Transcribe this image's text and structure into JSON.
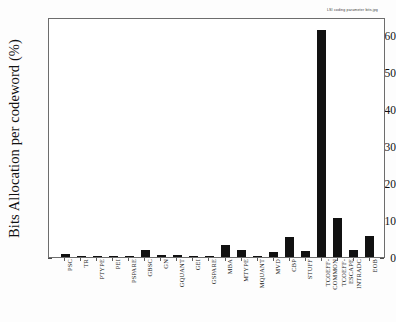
{
  "header_note": "LSI coding parameter bits.jpg",
  "chart_data": {
    "type": "bar",
    "title": "",
    "subtitle": "",
    "xlabel": "",
    "ylabel": "Bits Allocation per codeword (%)",
    "ylim": [
      0,
      65
    ],
    "yticks": [
      0,
      10,
      20,
      30,
      40,
      50,
      60
    ],
    "ytick_labels": [
      "0",
      "10",
      "20",
      "30",
      "40",
      "50",
      "60"
    ],
    "grid": false,
    "legend": null,
    "bar_color": "#111111",
    "categories": [
      "PSC",
      "TR",
      "PTYPE",
      "PEI",
      "PSPARE",
      "GBSC",
      "GN",
      "GQUANT",
      "GEI",
      "GSPARE",
      "MBA",
      "MTYPE",
      "MQUANT",
      "MVD",
      "CBP",
      "STUFF",
      "TCOEFF-COMMON",
      "TCOEFF-ESCAPE",
      "INTRADC",
      "EOB"
    ],
    "category_lines": [
      [
        "PSC"
      ],
      [
        "TR"
      ],
      [
        "PTYPE"
      ],
      [
        "PEI"
      ],
      [
        "PSPARE"
      ],
      [
        "GBSC"
      ],
      [
        "GN"
      ],
      [
        "GQUANT"
      ],
      [
        "GEI"
      ],
      [
        "GSPARE"
      ],
      [
        "MBA"
      ],
      [
        "MTYPE"
      ],
      [
        "MQUANT"
      ],
      [
        "MVD"
      ],
      [
        "CBP"
      ],
      [
        "STUFF"
      ],
      [
        "TCOEFF-",
        "COMMON"
      ],
      [
        "TCOEFF-",
        "ESCAPE"
      ],
      [
        "INTRADC"
      ],
      [
        "EOB"
      ]
    ],
    "values": [
      0.9,
      0.2,
      0.3,
      0.05,
      0.05,
      2.0,
      0.5,
      0.6,
      0.2,
      0.05,
      3.2,
      1.8,
      0.05,
      1.4,
      5.3,
      1.6,
      61.5,
      10.7,
      2.0,
      5.8
    ]
  }
}
